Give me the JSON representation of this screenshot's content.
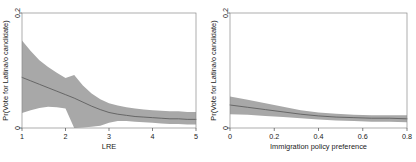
{
  "figure": {
    "background_color": "#ffffff",
    "band_color": "#a8a8a8",
    "line_color": "#555555",
    "frame_color": "#8a8a8a"
  },
  "chart_data": [
    {
      "type": "line",
      "panel": "left",
      "title": "",
      "xlabel": "LRE",
      "ylabel": "Pr(Vote for Latina/o candidate)",
      "xlim": [
        1,
        5
      ],
      "ylim": [
        0,
        0.2
      ],
      "xticks": [
        1,
        2,
        3,
        4,
        5
      ],
      "xticklabels": [
        "1",
        "2",
        "3",
        "4",
        "5"
      ],
      "yticks": [
        0,
        0.2
      ],
      "yticklabels": [
        "0",
        "0.2"
      ],
      "grid": false,
      "legend": "none",
      "x": [
        1.0,
        1.2,
        1.4,
        1.6,
        1.8,
        2.0,
        2.2,
        2.4,
        2.6,
        2.8,
        3.0,
        3.2,
        3.4,
        3.6,
        3.8,
        4.0,
        4.2,
        4.4,
        4.6,
        4.8,
        5.0
      ],
      "series": [
        {
          "name": "Predicted probability",
          "values": [
            0.088,
            0.082,
            0.076,
            0.07,
            0.064,
            0.058,
            0.052,
            0.045,
            0.038,
            0.032,
            0.027,
            0.024,
            0.022,
            0.02,
            0.019,
            0.018,
            0.017,
            0.016,
            0.016,
            0.015,
            0.015
          ]
        },
        {
          "name": "95% CI upper",
          "values": [
            0.152,
            0.134,
            0.118,
            0.106,
            0.096,
            0.087,
            0.092,
            0.074,
            0.06,
            0.05,
            0.043,
            0.039,
            0.036,
            0.034,
            0.032,
            0.031,
            0.03,
            0.029,
            0.029,
            0.028,
            0.028
          ]
        },
        {
          "name": "95% CI lower",
          "values": [
            0.026,
            0.031,
            0.035,
            0.037,
            0.036,
            0.034,
            0.0,
            0.001,
            0.002,
            0.004,
            0.009,
            0.012,
            0.012,
            0.011,
            0.01,
            0.009,
            0.008,
            0.007,
            0.007,
            0.006,
            0.006
          ]
        }
      ]
    },
    {
      "type": "line",
      "panel": "right",
      "title": "",
      "xlabel": "Immigration policy preference",
      "ylabel": "Pr(Vote for Latina/o candidate)",
      "xlim": [
        0,
        0.8
      ],
      "ylim": [
        0,
        0.2
      ],
      "xticks": [
        0,
        0.2,
        0.4,
        0.6,
        0.8
      ],
      "xticklabels": [
        "0",
        "0.2",
        "0.4",
        "0.6",
        "0.8"
      ],
      "yticks": [
        0,
        0.2
      ],
      "yticklabels": [
        "0",
        "0.2"
      ],
      "grid": false,
      "legend": "none",
      "x": [
        0.0,
        0.08,
        0.16,
        0.24,
        0.32,
        0.4,
        0.48,
        0.56,
        0.64,
        0.72,
        0.8
      ],
      "series": [
        {
          "name": "Predicted probability",
          "values": [
            0.04,
            0.036,
            0.032,
            0.028,
            0.024,
            0.021,
            0.019,
            0.018,
            0.017,
            0.017,
            0.016
          ]
        },
        {
          "name": "95% CI upper",
          "values": [
            0.055,
            0.049,
            0.043,
            0.037,
            0.031,
            0.027,
            0.025,
            0.023,
            0.022,
            0.022,
            0.022
          ]
        },
        {
          "name": "95% CI lower",
          "values": [
            0.024,
            0.023,
            0.021,
            0.019,
            0.017,
            0.015,
            0.013,
            0.012,
            0.011,
            0.011,
            0.01
          ]
        }
      ]
    }
  ]
}
